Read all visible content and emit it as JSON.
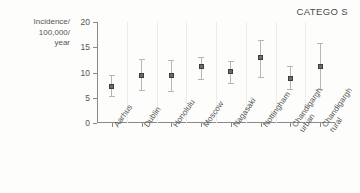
{
  "chart_data": {
    "type": "scatter",
    "title": "CATEGO S",
    "xlabel": "",
    "ylabel": "Incidence/ 100,000/ year",
    "ylabel_lines": [
      "Incidence/",
      "100,000/",
      "year"
    ],
    "ylim": [
      0,
      20
    ],
    "yticks": [
      0,
      5,
      10,
      15,
      20
    ],
    "ytick_labels": [
      "0",
      "5",
      "10",
      "15",
      "20"
    ],
    "grid": "vertical-category-separators",
    "legend": "none",
    "categories": [
      "Aarhus",
      "Dublin",
      "Honolulu",
      "Moscow",
      "Nagasaki",
      "Nottingham",
      "Chandigargh urban",
      "Chandigargh rural"
    ],
    "category_label_lines": [
      [
        "Aarhus"
      ],
      [
        "Dublin"
      ],
      [
        "Honolulu"
      ],
      [
        "Moscow"
      ],
      [
        "Nagasaki"
      ],
      [
        "Nottingham"
      ],
      [
        "Chandigargh",
        "urban"
      ],
      [
        "Chandigargh",
        "rural"
      ]
    ],
    "values": [
      7.2,
      9.4,
      9.4,
      11.1,
      10.2,
      12.9,
      8.9,
      11.2
    ],
    "error_low": [
      5.3,
      6.5,
      6.4,
      8.7,
      8.0,
      9.2,
      6.8,
      6.8
    ],
    "error_high": [
      9.5,
      12.6,
      12.5,
      13.0,
      12.2,
      16.4,
      11.3,
      15.9
    ],
    "marker_color": "#6b6b6b",
    "errorbar_color": "#b6b6b6",
    "axis_color": "#8a8a8a",
    "grid_color": "#ececec",
    "background": "#fdfdfc"
  }
}
